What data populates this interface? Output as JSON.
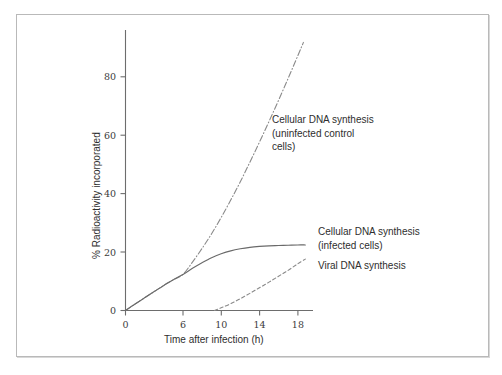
{
  "figure": {
    "background_color": "#ffffff",
    "frame_color": "#b9b9b9",
    "axis_color": "#6d6d6d"
  },
  "chart_data": {
    "type": "line",
    "title": "",
    "subtitle": "",
    "xlabel": "Time after infection (h)",
    "ylabel": "% Radioactivity incorporated",
    "xlim": [
      0,
      19.6
    ],
    "ylim": [
      0,
      95
    ],
    "xticks": [
      0,
      6,
      10,
      14,
      18
    ],
    "xticklabels": [
      "0",
      "6",
      "10",
      "14",
      "18"
    ],
    "yticks": [
      0,
      20,
      40,
      60,
      80
    ],
    "yticklabels": [
      "0",
      "20",
      "40",
      "60",
      "80"
    ],
    "grid": false,
    "legend_position": "inline-annotations",
    "series": [
      {
        "name": "Cellular DNA synthesis (uninfected control cells)",
        "style": "dash-dot",
        "color": "#8a8a8a",
        "x": [
          0,
          1,
          2,
          3,
          4,
          5,
          6,
          7,
          8,
          9,
          10,
          11,
          12,
          13,
          14,
          15,
          16,
          17,
          18,
          18.6
        ],
        "y": [
          0,
          2.2,
          4.3,
          6.4,
          8.5,
          10.4,
          12.2,
          16.4,
          21.0,
          26.0,
          31.5,
          37.4,
          43.6,
          50.2,
          57.0,
          64.0,
          71.2,
          78.6,
          86.2,
          90.8
        ]
      },
      {
        "name": "Cellular DNA synthesis (infected cells)",
        "style": "solid",
        "color": "#6a6a6a",
        "x": [
          0,
          1,
          2,
          3,
          4,
          5,
          6,
          7,
          8,
          9,
          10,
          11,
          12,
          13,
          14,
          15,
          16,
          17,
          18,
          18.8
        ],
        "y": [
          0,
          2.2,
          4.3,
          6.4,
          8.5,
          10.4,
          12.2,
          14.3,
          16.2,
          17.9,
          19.2,
          20.2,
          20.9,
          21.4,
          21.7,
          21.9,
          22.0,
          22.1,
          22.2,
          22.2
        ]
      },
      {
        "name": "Viral DNA synthesis",
        "style": "dashed",
        "color": "#8a8a8a",
        "x": [
          9.3,
          10,
          11,
          12,
          13,
          14,
          15,
          16,
          17,
          18,
          18.8
        ],
        "y": [
          0,
          0.9,
          2.3,
          4.0,
          5.8,
          7.7,
          9.6,
          11.6,
          13.6,
          15.8,
          17.4
        ]
      }
    ],
    "annotations": [
      {
        "id": "control-label",
        "text": "Cellular DNA synthesis\n(uninfected control\ncells)",
        "series": "Cellular DNA synthesis (uninfected control cells)"
      },
      {
        "id": "infected-label",
        "text": "Cellular DNA synthesis\n(infected cells)",
        "series": "Cellular DNA synthesis (infected cells)"
      },
      {
        "id": "viral-label",
        "text": "Viral DNA synthesis",
        "series": "Viral DNA synthesis"
      }
    ]
  },
  "axis_labels": {
    "x_title": "Time after infection (h)",
    "y_title": "% Radioactivity incorporated",
    "x_ticks": [
      "0",
      "6",
      "10",
      "14",
      "18"
    ],
    "y_ticks": [
      "0",
      "20",
      "40",
      "60",
      "80"
    ]
  },
  "annotations": {
    "control": "Cellular DNA synthesis\n(uninfected control\ncells)",
    "infected": "Cellular DNA synthesis\n(infected cells)",
    "viral": "Viral DNA synthesis"
  }
}
